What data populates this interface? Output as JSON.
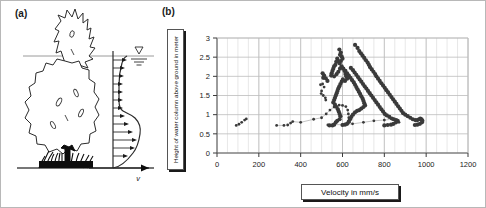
{
  "figure": {
    "panels": [
      {
        "id": "a",
        "label": "(a)"
      },
      {
        "id": "b",
        "label": "(b)"
      }
    ]
  },
  "panel_a": {
    "label": "(a)",
    "velocity_axis_label": "v",
    "water_table_symbol": "water-table-triangle",
    "elements": [
      "tree-illustration",
      "grass-tuft",
      "ground-line",
      "water-surface-line",
      "velocity-profile-curve",
      "velocity-arrows",
      "vertical-axis"
    ]
  },
  "panel_b": {
    "label": "(b)"
  },
  "chart_data": {
    "type": "scatter",
    "title": "",
    "xlabel": "Velocity  in mm/s",
    "ylabel": "Height of water column above ground in meter",
    "xlim": [
      0,
      1200
    ],
    "ylim": [
      0,
      3
    ],
    "xticks": [
      0,
      200,
      400,
      600,
      800,
      1000,
      1200
    ],
    "yticks": [
      0,
      0.5,
      1,
      1.5,
      2,
      2.5,
      3
    ],
    "x_minor_step": 50,
    "grid": true,
    "legend": null,
    "marker_color": "#3a3a3a",
    "series": [
      {
        "name": "profile-1",
        "connected": false,
        "marker_size": "small",
        "points": [
          [
            92,
            0.72
          ],
          [
            105,
            0.75
          ],
          [
            118,
            0.8
          ],
          [
            132,
            0.86
          ],
          [
            140,
            0.89
          ]
        ]
      },
      {
        "name": "profile-2",
        "connected": true,
        "marker_size": "small",
        "points": [
          [
            285,
            0.72
          ],
          [
            320,
            0.72
          ],
          [
            338,
            0.73
          ],
          [
            352,
            0.78
          ],
          [
            362,
            0.82
          ],
          [
            400,
            0.8
          ],
          [
            462,
            0.88
          ],
          [
            500,
            0.92
          ],
          [
            522,
            1.02
          ],
          [
            540,
            1.12
          ],
          [
            560,
            1.2
          ],
          [
            584,
            1.25
          ],
          [
            600,
            1.24
          ],
          [
            616,
            1.21
          ],
          [
            625,
            1.12
          ],
          [
            628,
            1.02
          ],
          [
            630,
            0.92
          ],
          [
            632,
            0.8
          ]
        ]
      },
      {
        "name": "profile-3",
        "connected": false,
        "marker_size": "small",
        "points": [
          [
            495,
            1.78
          ],
          [
            505,
            1.8
          ],
          [
            512,
            1.72
          ],
          [
            500,
            1.62
          ],
          [
            498,
            1.55
          ],
          [
            508,
            1.5
          ],
          [
            518,
            1.44
          ],
          [
            520,
            1.38
          ]
        ]
      },
      {
        "name": "profile-4",
        "connected": false,
        "marker_size": "medium",
        "points": [
          [
            505,
            2.08
          ],
          [
            512,
            2.02
          ],
          [
            520,
            1.95
          ],
          [
            528,
            1.88
          ],
          [
            508,
            1.96
          ],
          [
            585,
            2.7
          ],
          [
            592,
            2.62
          ],
          [
            588,
            2.56
          ],
          [
            596,
            2.52
          ],
          [
            600,
            2.46
          ],
          [
            592,
            2.4
          ],
          [
            586,
            2.34
          ],
          [
            580,
            2.4
          ],
          [
            575,
            2.46
          ],
          [
            570,
            2.38
          ],
          [
            566,
            2.3
          ],
          [
            560,
            2.26
          ],
          [
            556,
            2.2
          ],
          [
            552,
            2.14
          ],
          [
            548,
            2.08
          ],
          [
            546,
            2.02
          ],
          [
            560,
            2.0
          ],
          [
            572,
            2.06
          ],
          [
            580,
            2.12
          ],
          [
            588,
            2.2
          ],
          [
            596,
            2.26
          ],
          [
            604,
            2.2
          ],
          [
            610,
            2.14
          ],
          [
            614,
            2.06
          ],
          [
            618,
            2.0
          ],
          [
            622,
            1.94
          ],
          [
            612,
            1.88
          ],
          [
            602,
            1.92
          ],
          [
            596,
            1.86
          ],
          [
            590,
            1.8
          ],
          [
            585,
            1.74
          ],
          [
            580,
            1.68
          ],
          [
            576,
            1.62
          ],
          [
            572,
            1.56
          ],
          [
            568,
            1.5
          ],
          [
            564,
            1.44
          ],
          [
            560,
            1.38
          ],
          [
            556,
            1.32
          ],
          [
            564,
            1.26
          ],
          [
            572,
            1.2
          ],
          [
            578,
            1.14
          ],
          [
            582,
            1.08
          ],
          [
            586,
            1.02
          ],
          [
            590,
            0.96
          ],
          [
            586,
            0.88
          ],
          [
            575,
            0.84
          ],
          [
            568,
            0.8
          ],
          [
            560,
            0.74
          ],
          [
            552,
            0.72
          ],
          [
            538,
            0.72
          ]
        ]
      },
      {
        "name": "profile-5",
        "connected": false,
        "marker_size": "medium",
        "points": [
          [
            660,
            2.82
          ],
          [
            672,
            2.74
          ],
          [
            680,
            2.66
          ],
          [
            688,
            2.6
          ],
          [
            696,
            2.54
          ],
          [
            704,
            2.48
          ],
          [
            712,
            2.42
          ],
          [
            720,
            2.36
          ],
          [
            726,
            2.3
          ],
          [
            732,
            2.24
          ],
          [
            740,
            2.18
          ],
          [
            748,
            2.12
          ],
          [
            756,
            2.06
          ],
          [
            762,
            2.0
          ],
          [
            770,
            1.94
          ],
          [
            778,
            1.88
          ],
          [
            786,
            1.82
          ],
          [
            794,
            1.76
          ],
          [
            802,
            1.7
          ],
          [
            810,
            1.64
          ],
          [
            818,
            1.58
          ],
          [
            826,
            1.52
          ],
          [
            834,
            1.46
          ],
          [
            842,
            1.4
          ],
          [
            850,
            1.34
          ],
          [
            858,
            1.28
          ],
          [
            866,
            1.22
          ],
          [
            874,
            1.16
          ],
          [
            882,
            1.1
          ],
          [
            890,
            1.04
          ],
          [
            900,
            1.0
          ],
          [
            912,
            0.96
          ],
          [
            924,
            0.92
          ],
          [
            936,
            0.88
          ],
          [
            948,
            0.86
          ],
          [
            958,
            0.86
          ],
          [
            966,
            0.88
          ],
          [
            972,
            0.9
          ],
          [
            978,
            0.88
          ],
          [
            982,
            0.84
          ],
          [
            980,
            0.8
          ],
          [
            970,
            0.76
          ],
          [
            958,
            0.74
          ],
          [
            946,
            0.73
          ]
        ]
      },
      {
        "name": "profile-6",
        "connected": false,
        "marker_size": "medium",
        "points": [
          [
            640,
            2.22
          ],
          [
            650,
            2.16
          ],
          [
            658,
            2.1
          ],
          [
            666,
            2.04
          ],
          [
            674,
            1.98
          ],
          [
            682,
            1.92
          ],
          [
            690,
            1.86
          ],
          [
            698,
            1.8
          ],
          [
            706,
            1.74
          ],
          [
            714,
            1.68
          ],
          [
            722,
            1.62
          ],
          [
            730,
            1.56
          ],
          [
            738,
            1.5
          ],
          [
            746,
            1.44
          ],
          [
            754,
            1.38
          ],
          [
            762,
            1.32
          ],
          [
            770,
            1.26
          ],
          [
            778,
            1.2
          ],
          [
            786,
            1.14
          ],
          [
            794,
            1.08
          ],
          [
            802,
            1.02
          ],
          [
            812,
            0.98
          ],
          [
            824,
            0.94
          ],
          [
            836,
            0.9
          ],
          [
            846,
            0.88
          ],
          [
            856,
            0.86
          ],
          [
            864,
            0.84
          ],
          [
            856,
            0.8
          ],
          [
            844,
            0.76
          ],
          [
            832,
            0.74
          ],
          [
            816,
            0.73
          ],
          [
            800,
            0.72
          ]
        ]
      },
      {
        "name": "profile-7",
        "connected": false,
        "marker_size": "medium",
        "points": [
          [
            614,
            2.14
          ],
          [
            622,
            2.08
          ],
          [
            630,
            2.02
          ],
          [
            638,
            1.96
          ],
          [
            646,
            1.9
          ],
          [
            654,
            1.84
          ],
          [
            660,
            1.78
          ],
          [
            666,
            1.72
          ],
          [
            672,
            1.66
          ],
          [
            678,
            1.6
          ],
          [
            684,
            1.54
          ],
          [
            690,
            1.48
          ],
          [
            696,
            1.42
          ],
          [
            700,
            1.36
          ],
          [
            704,
            1.3
          ],
          [
            708,
            1.24
          ],
          [
            700,
            1.2
          ],
          [
            690,
            1.16
          ],
          [
            680,
            1.12
          ],
          [
            670,
            1.1
          ],
          [
            660,
            1.06
          ],
          [
            650,
            1.0
          ],
          [
            642,
            0.94
          ],
          [
            636,
            0.88
          ],
          [
            630,
            0.82
          ],
          [
            622,
            0.76
          ],
          [
            612,
            0.74
          ],
          [
            600,
            0.73
          ]
        ]
      },
      {
        "name": "profile-8",
        "connected": true,
        "marker_size": "small",
        "points": [
          [
            530,
            0.73
          ],
          [
            556,
            0.74
          ],
          [
            600,
            0.74
          ],
          [
            648,
            0.76
          ],
          [
            700,
            0.8
          ],
          [
            750,
            0.84
          ],
          [
            800,
            0.86
          ],
          [
            840,
            0.88
          ],
          [
            860,
            0.86
          ],
          [
            870,
            0.8
          ]
        ]
      }
    ]
  }
}
